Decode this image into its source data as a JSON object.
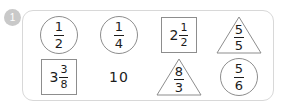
{
  "badge": {
    "label": "1",
    "color": "#c9c9c9",
    "text_color": "#ffffff"
  },
  "card": {
    "border_color": "#d8d8d8",
    "background": "#ffffff",
    "corner_radius": "11px"
  },
  "style": {
    "shape_stroke": "#8d8d8d",
    "text_color": "#1c1c1c"
  },
  "items": [
    {
      "id": "item-1",
      "shape": "circle",
      "kind": "fraction",
      "whole": "",
      "numerator": "1",
      "denominator": "2",
      "text": "1/2"
    },
    {
      "id": "item-2",
      "shape": "circle",
      "kind": "fraction",
      "whole": "",
      "numerator": "1",
      "denominator": "4",
      "text": "1/4"
    },
    {
      "id": "item-3",
      "shape": "square",
      "kind": "mixed",
      "whole": "2",
      "numerator": "1",
      "denominator": "2",
      "text": "2 1/2"
    },
    {
      "id": "item-4",
      "shape": "triangle",
      "kind": "fraction",
      "whole": "",
      "numerator": "5",
      "denominator": "5",
      "text": "5/5"
    },
    {
      "id": "item-5",
      "shape": "square",
      "kind": "mixed",
      "whole": "3",
      "numerator": "3",
      "denominator": "8",
      "text": "3 3/8"
    },
    {
      "id": "item-6",
      "shape": "none",
      "kind": "whole",
      "whole": "10",
      "numerator": "",
      "denominator": "",
      "text": "10"
    },
    {
      "id": "item-7",
      "shape": "triangle",
      "kind": "fraction",
      "whole": "",
      "numerator": "8",
      "denominator": "3",
      "text": "8/3"
    },
    {
      "id": "item-8",
      "shape": "circle",
      "kind": "fraction",
      "whole": "",
      "numerator": "5",
      "denominator": "6",
      "text": "5/6"
    }
  ]
}
